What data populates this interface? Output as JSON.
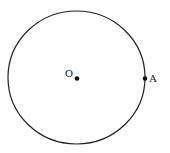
{
  "diagram": {
    "type": "circle-geometry",
    "circle": {
      "cx": 76.5,
      "cy": 77.5,
      "rx": 68.5,
      "ry": 66.5,
      "stroke": "#222222"
    },
    "points": [
      {
        "id": "O",
        "label": "O",
        "x": 77,
        "y": 78,
        "role": "center"
      },
      {
        "id": "A",
        "label": "A",
        "x": 145,
        "y": 78,
        "role": "on-circle"
      }
    ]
  }
}
